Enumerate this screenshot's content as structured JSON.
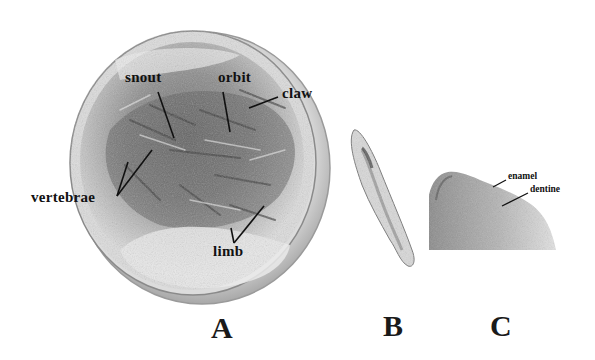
{
  "figure": {
    "panels": [
      {
        "id": "A",
        "letter": "A",
        "description": "Disc-shaped fossil nodule with embedded skeleton",
        "annotations": {
          "snout": "snout",
          "orbit": "orbit",
          "claw": "claw",
          "vertebrae": "vertebrae",
          "limb": "limb"
        }
      },
      {
        "id": "B",
        "letter": "B",
        "description": "Elongated tooth/bone specimen"
      },
      {
        "id": "C",
        "letter": "C",
        "description": "Close-up of tooth tip",
        "annotations": {
          "enamel": "enamel",
          "dentine": "dentine"
        }
      }
    ],
    "colors": {
      "background": "#ffffff",
      "label_text": "#111111",
      "leader_line": "#111111"
    }
  }
}
